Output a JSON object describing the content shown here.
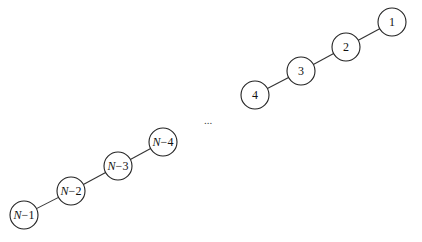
{
  "diagram": {
    "type": "linked-chain",
    "upper_chain": {
      "nodes": [
        {
          "id": "n1",
          "label": "1",
          "italic_prefix": "",
          "cx": 392,
          "cy": 22
        },
        {
          "id": "n2",
          "label": "2",
          "italic_prefix": "",
          "cx": 346,
          "cy": 47
        },
        {
          "id": "n3",
          "label": "3",
          "italic_prefix": "",
          "cx": 301,
          "cy": 71
        },
        {
          "id": "n4",
          "label": "4",
          "italic_prefix": "",
          "cx": 255,
          "cy": 95
        }
      ]
    },
    "lower_chain": {
      "nodes": [
        {
          "id": "nN4",
          "label": "−4",
          "italic_prefix": "N",
          "cx": 163,
          "cy": 142
        },
        {
          "id": "nN3",
          "label": "−3",
          "italic_prefix": "N",
          "cx": 118,
          "cy": 166
        },
        {
          "id": "nN2",
          "label": "−2",
          "italic_prefix": "N",
          "cx": 71,
          "cy": 191
        },
        {
          "id": "nN1",
          "label": "−1",
          "italic_prefix": "N",
          "cx": 24,
          "cy": 215
        }
      ]
    },
    "edges": [
      [
        "n1",
        "n2"
      ],
      [
        "n2",
        "n3"
      ],
      [
        "n3",
        "n4"
      ],
      [
        "nN4",
        "nN3"
      ],
      [
        "nN3",
        "nN2"
      ],
      [
        "nN2",
        "nN1"
      ]
    ],
    "ellipsis": {
      "text": "...",
      "x": 208,
      "y": 124
    },
    "node_radius": 14,
    "colors": {
      "stroke": "#222222",
      "fill": "#ffffff",
      "text": "#111111"
    }
  }
}
